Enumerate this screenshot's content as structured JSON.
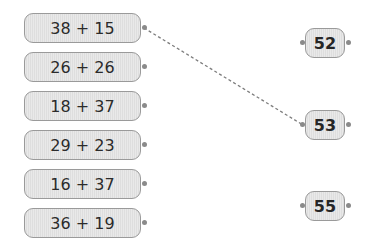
{
  "left_items": [
    {
      "label": "38 + 15",
      "top": 13
    },
    {
      "label": "26 + 26",
      "top": 52
    },
    {
      "label": "18 + 37",
      "top": 91
    },
    {
      "label": "29 + 23",
      "top": 130
    },
    {
      "label": "16 + 37",
      "top": 169
    },
    {
      "label": "36 + 19",
      "top": 208
    }
  ],
  "right_items": [
    {
      "label": "52",
      "top": 28
    },
    {
      "label": "53",
      "top": 110
    },
    {
      "label": "55",
      "top": 191
    }
  ],
  "connections": [
    {
      "from": "38 + 15",
      "to": "53",
      "style": "dashed"
    }
  ],
  "colors": {
    "box_fill": "#e6e6e6",
    "box_border": "#9a9a9a",
    "connector": "#8a8a8a",
    "text": "#2b2b2b"
  }
}
